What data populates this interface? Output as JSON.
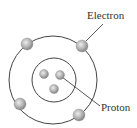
{
  "diagram": {
    "labels": {
      "electron": "Electron",
      "proton": "Proton"
    },
    "colors": {
      "stroke": "#444444",
      "particle_light": "#e6e6e6",
      "particle_dark": "#8a8a8a",
      "text": "#333333",
      "background": "#ffffff"
    },
    "orbit": {
      "cx": 53,
      "cy": 80,
      "r": 44
    },
    "nucleus": {
      "cx": 54,
      "cy": 80,
      "r": 22
    },
    "electrons": [
      {
        "cx": 27,
        "cy": 44,
        "r": 6
      },
      {
        "cx": 82,
        "cy": 46,
        "r": 6
      },
      {
        "cx": 20,
        "cy": 104,
        "r": 6
      },
      {
        "cx": 79,
        "cy": 115,
        "r": 6
      }
    ],
    "protons": [
      {
        "cx": 44,
        "cy": 74,
        "r": 4.5
      },
      {
        "cx": 60,
        "cy": 75,
        "r": 4.5
      },
      {
        "cx": 54,
        "cy": 89,
        "r": 4.5
      }
    ],
    "leaders": {
      "electron": {
        "x1": 86,
        "y1": 41,
        "x2": 103,
        "y2": 24
      },
      "proton": {
        "x1": 62,
        "y1": 77,
        "x2": 100,
        "y2": 106
      }
    }
  }
}
